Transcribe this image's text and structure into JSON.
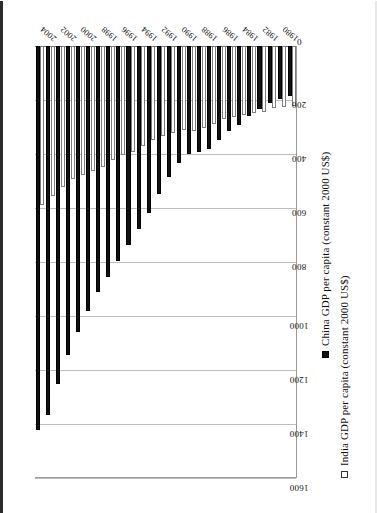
{
  "chart_data": {
    "type": "bar",
    "orientation": "horizontal",
    "title": "",
    "xlabel": "",
    "ylabel": "",
    "xlim": [
      0,
      1600
    ],
    "xticks": [
      0,
      200,
      400,
      600,
      800,
      1000,
      1200,
      1400,
      1600
    ],
    "xtick_labels": [
      "0",
      "200",
      "400",
      "600",
      "800",
      "1000",
      "1200",
      "1400",
      "1600"
    ],
    "grid": true,
    "legend_position": "right",
    "categories": [
      "1980",
      "1981",
      "1982",
      "1983",
      "1984",
      "1985",
      "1986",
      "1987",
      "1988",
      "1989",
      "1990",
      "1991",
      "1992",
      "1993",
      "1994",
      "1995",
      "1996",
      "1997",
      "1998",
      "1999",
      "2000",
      "2001",
      "2002",
      "2003",
      "2004",
      "2005"
    ],
    "category_tick_labels": [
      "1980",
      "",
      "1982",
      "",
      "1984",
      "",
      "1986",
      "",
      "1988",
      "",
      "1990",
      "",
      "1992",
      "",
      "1994",
      "",
      "1996",
      "",
      "1998",
      "",
      "2000",
      "",
      "2002",
      "",
      "2004",
      ""
    ],
    "series": [
      {
        "name": "China GDP per capita (constant 2000 US$)",
        "color": "#111111",
        "marker": "filled-square",
        "values": [
          186,
          196,
          212,
          232,
          261,
          294,
          315,
          348,
          382,
          391,
          400,
          432,
          487,
          550,
          617,
          678,
          737,
          798,
          854,
          913,
          981,
          1058,
          1146,
          1252,
          1368,
          1424
        ]
      },
      {
        "name": "India GDP per capita (constant 2000 US$)",
        "color": "#ffffff",
        "marker": "hollow-square",
        "values": [
          221,
          225,
          231,
          243,
          249,
          256,
          263,
          269,
          288,
          302,
          315,
          311,
          322,
          333,
          350,
          372,
          393,
          404,
          424,
          448,
          464,
          477,
          492,
          521,
          555,
          588
        ]
      }
    ]
  },
  "legend": {
    "china_label": "China GDP per capita (constant 2000 US$)",
    "india_label": "India GDP per capita (constant 2000 US$)"
  }
}
